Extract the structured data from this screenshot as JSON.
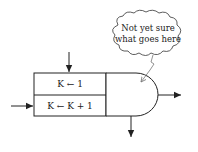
{
  "diagram": {
    "boxes": [
      {
        "id": "init",
        "label": "K ← 1"
      },
      {
        "id": "increment",
        "label": "K ← K + 1"
      }
    ],
    "decision_node": {
      "label": ""
    },
    "cloud_note": {
      "lines": [
        "Not yet sure",
        "what goes here"
      ]
    },
    "arrows": [
      {
        "name": "entry-top",
        "to": "init"
      },
      {
        "name": "entry-left",
        "to": "increment"
      },
      {
        "name": "exit-right",
        "from": "decision_node"
      },
      {
        "name": "exit-bottom",
        "from": "decision_node"
      }
    ],
    "colors": {
      "stroke": "#222222",
      "background": "#ffffff"
    }
  }
}
